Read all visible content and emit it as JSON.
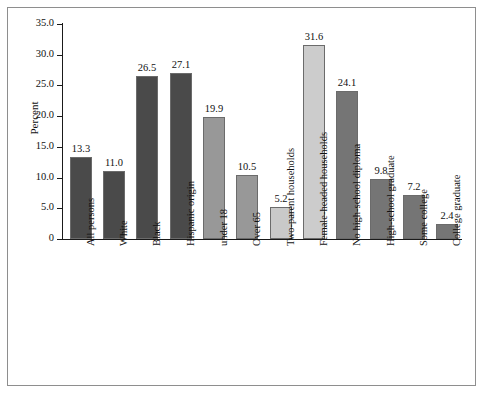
{
  "figure": {
    "background": "#ffffff",
    "frame_color": "#8e8e8e",
    "axis_color": "#1a1a1a",
    "bar_edge_color": "#6b6b6b"
  },
  "chart_data": {
    "type": "bar",
    "title": "",
    "xlabel": "",
    "ylabel": "Percent",
    "ylim": [
      0,
      35
    ],
    "ytick_labels": [
      "0",
      "5.0",
      "10.0",
      "15.0",
      "20.0",
      "25.0",
      "30.0",
      "35.0"
    ],
    "ytick_values": [
      0,
      5,
      10,
      15,
      20,
      25,
      30,
      35
    ],
    "grid": false,
    "legend": "none",
    "categories": [
      "All persons",
      "White",
      "Black",
      "Hispanic origin",
      "under 18",
      "Over 65",
      "Two-parent households",
      "Female-headed households",
      "No high-school diploma",
      "High-school graduate",
      "Some college",
      "College graduate"
    ],
    "values": [
      13.3,
      11.0,
      26.5,
      27.1,
      19.9,
      10.5,
      5.2,
      31.6,
      24.1,
      9.8,
      7.2,
      2.4
    ],
    "value_labels": [
      "13.3",
      "11.0",
      "26.5",
      "27.1",
      "19.9",
      "10.5",
      "5.2",
      "31.6",
      "24.1",
      "9.8",
      "7.2",
      "2.4"
    ],
    "bar_colors": [
      "#4a4a4a",
      "#4a4a4a",
      "#4a4a4a",
      "#4a4a4a",
      "#989898",
      "#989898",
      "#c9c9c9",
      "#cccccc",
      "#757575",
      "#757575",
      "#757575",
      "#757575"
    ]
  }
}
